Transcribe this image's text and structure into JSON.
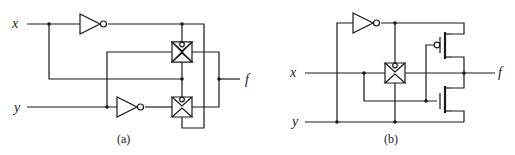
{
  "figure": {
    "colors": {
      "ink": "#1a1a1a",
      "background": "#ffffff"
    },
    "panels": [
      {
        "id": "a",
        "caption": "(a)",
        "inputs": [
          {
            "label": "x"
          },
          {
            "label": "y"
          }
        ],
        "output": {
          "label": "f"
        },
        "components": [
          "inverter",
          "inverter",
          "transmission-gate",
          "transmission-gate"
        ]
      },
      {
        "id": "b",
        "caption": "(b)",
        "inputs": [
          {
            "label": "x"
          },
          {
            "label": "y"
          }
        ],
        "output": {
          "label": "f"
        },
        "components": [
          "inverter",
          "transmission-gate",
          "pmos-transistor",
          "nmos-transistor"
        ]
      }
    ]
  }
}
